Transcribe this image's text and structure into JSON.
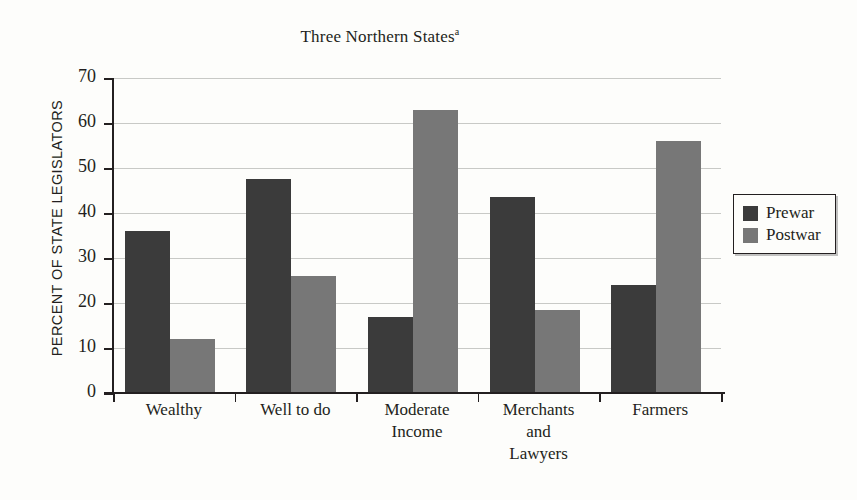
{
  "chart_data": {
    "type": "bar",
    "title": "Three Northern States",
    "title_superscript": "a",
    "xlabel": "",
    "ylabel": "PERCENT OF STATE LEGISLATORS",
    "ylim": [
      0,
      70
    ],
    "ytick_step": 10,
    "yticks": [
      "70",
      "60",
      "50",
      "40",
      "30",
      "20",
      "10",
      "0"
    ],
    "grid": "horizontal",
    "legend_position": "right",
    "categories": [
      "Wealthy",
      "Well to do",
      "Moderate\nIncome",
      "Merchants\nand\nLawyers",
      "Farmers"
    ],
    "category_lines": [
      [
        "Wealthy"
      ],
      [
        "Well to do"
      ],
      [
        "Moderate",
        "Income"
      ],
      [
        "Merchants",
        "and",
        "Lawyers"
      ],
      [
        "Farmers"
      ]
    ],
    "series": [
      {
        "name": "Prewar",
        "color": "#3b3b3b",
        "values": [
          36,
          47.5,
          17,
          43.5,
          24
        ]
      },
      {
        "name": "Postwar",
        "color": "#777777",
        "values": [
          12,
          26,
          63,
          18.5,
          56
        ]
      }
    ]
  },
  "legend": {
    "items": [
      {
        "label": "Prewar",
        "swatch": "prewar"
      },
      {
        "label": "Postwar",
        "swatch": "postwar"
      }
    ]
  },
  "colors": {
    "prewar": "#3b3b3b",
    "postwar": "#777777",
    "axis": "#231f20",
    "gridline": "#c8c9c6",
    "background": "#fdfdfb"
  }
}
